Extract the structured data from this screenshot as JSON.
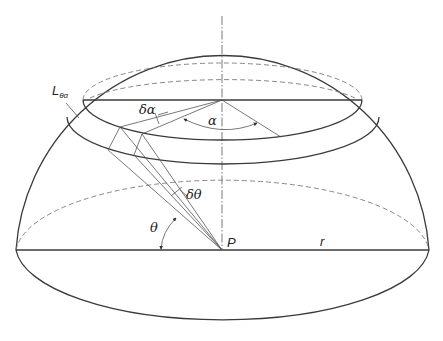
{
  "figure": {
    "colors": {
      "stroke": "#3a3a3a",
      "hidden_line": "#7a7a7a",
      "background": "#ffffff"
    }
  },
  "labels": {
    "zone": "L",
    "zone_sub": "θα",
    "d_alpha": "δα",
    "alpha": "α",
    "d_theta": "δθ",
    "theta": "θ",
    "point": "P",
    "radius": "r"
  }
}
